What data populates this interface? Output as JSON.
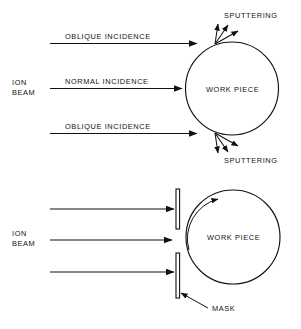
{
  "figure": {
    "type": "technical-diagram",
    "stroke_color": "#111111",
    "background_color": "#ffffff"
  },
  "panels": [
    {
      "id": "top-panel",
      "name": "unmasked-ion-beam-panel",
      "beam_label_line1": "ION",
      "beam_label_line2": "BEAM",
      "target_label": "WORK PIECE",
      "beams": [
        {
          "name": "upper-oblique-beam",
          "label": "OBLIQUE INCIDENCE"
        },
        {
          "name": "normal-beam",
          "label": "NORMAL INCIDENCE"
        },
        {
          "name": "lower-oblique-beam",
          "label": "OBLIQUE INCIDENCE"
        }
      ],
      "sputtering_top_label": "SPUTTERING",
      "sputtering_bottom_label": "SPUTTERING",
      "sputter_arrow_count": 3
    },
    {
      "id": "bottom-panel",
      "name": "masked-ion-beam-panel",
      "beam_label_line1": "ION",
      "beam_label_line2": "BEAM",
      "target_label": "WORK PIECE",
      "mask_label": "MASK",
      "mask_count": 2,
      "rotation_indicator": "clockwise-arc-arrow",
      "beams": [
        {
          "name": "upper-blocked-beam",
          "label": ""
        },
        {
          "name": "center-passing-beam",
          "label": ""
        },
        {
          "name": "lower-blocked-beam",
          "label": ""
        }
      ]
    }
  ]
}
